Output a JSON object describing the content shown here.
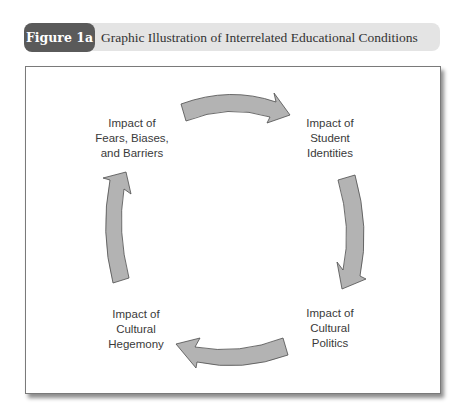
{
  "figure": {
    "number_label": "Figure 1a",
    "title": "Graphic Illustration of Interrelated Educational Conditions"
  },
  "colors": {
    "pill": "#5a5a5a",
    "header_bar": "#e4e4e4",
    "arrow_fill": "#b3b3b3",
    "arrow_stroke": "#4d4d4d"
  },
  "nodes": [
    {
      "id": "fears",
      "lines": [
        "Impact of",
        "Fears, Biases,",
        "and Barriers"
      ]
    },
    {
      "id": "identities",
      "lines": [
        "Impact of",
        "Student",
        "Identities"
      ]
    },
    {
      "id": "politics",
      "lines": [
        "Impact of",
        "Cultural",
        "Politics"
      ]
    },
    {
      "id": "hegemony",
      "lines": [
        "Impact of",
        "Cultural",
        "Hegemony"
      ]
    }
  ],
  "edges": [
    {
      "from": "fears",
      "to": "identities",
      "direction": "clockwise"
    },
    {
      "from": "identities",
      "to": "politics",
      "direction": "clockwise"
    },
    {
      "from": "politics",
      "to": "hegemony",
      "direction": "clockwise"
    },
    {
      "from": "hegemony",
      "to": "fears",
      "direction": "clockwise"
    }
  ]
}
